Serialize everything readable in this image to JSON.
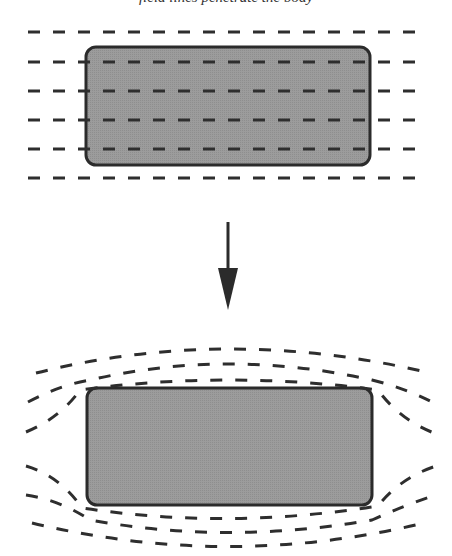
{
  "caption": "field lines penetrate the body",
  "colors": {
    "background": "#ffffff",
    "body_fill": "#9a9a9a",
    "body_stroke": "#2b2b2b",
    "field_line": "#2e2e2e",
    "arrow": "#2b2b2b"
  },
  "top_panel": {
    "label": "uniform-field",
    "field_line_ys": [
      32,
      62,
      91,
      120,
      149,
      178
    ],
    "field_x_start": 28,
    "field_x_end": 422,
    "body": {
      "x": 86,
      "y": 47,
      "width": 284,
      "height": 118,
      "radius": 10
    }
  },
  "arrow": {
    "x": 228,
    "y_start": 222,
    "y_end": 310,
    "head_top": 268,
    "head_half_width": 10
  },
  "bottom_panel": {
    "label": "expelled-field",
    "body": {
      "x": 87,
      "y": 388,
      "width": 285,
      "height": 117,
      "radius": 10
    }
  }
}
